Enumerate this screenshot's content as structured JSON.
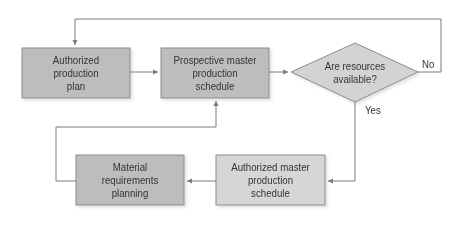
{
  "diagram": {
    "type": "flowchart",
    "colors": {
      "box_dark": "#bdbdbd",
      "box_light": "#d6d6d6",
      "diamond": "#d3d3d3",
      "border": "#8c8c8c",
      "line": "#7a7a7a",
      "text": "#333333"
    },
    "nodes": [
      {
        "id": "authorized-production-plan",
        "shape": "rect",
        "label": "Authorized production plan",
        "lines": [
          "Authorized",
          "production",
          "plan"
        ]
      },
      {
        "id": "prospective-mps",
        "shape": "rect",
        "label": "Prospective master production schedule",
        "lines": [
          "Prospective master",
          "production",
          "schedule"
        ]
      },
      {
        "id": "resources-decision",
        "shape": "diamond",
        "label": "Are resources available?",
        "lines": [
          "Are resources",
          "available?"
        ]
      },
      {
        "id": "authorized-mps",
        "shape": "rect",
        "label": "Authorized master production schedule",
        "lines": [
          "Authorized master",
          "production",
          "schedule"
        ]
      },
      {
        "id": "mrp",
        "shape": "rect",
        "label": "Material requirements planning",
        "lines": [
          "Material",
          "requirements",
          "planning"
        ]
      }
    ],
    "edges": [
      {
        "from": "authorized-production-plan",
        "to": "prospective-mps",
        "label": ""
      },
      {
        "from": "prospective-mps",
        "to": "resources-decision",
        "label": ""
      },
      {
        "from": "resources-decision",
        "to": "authorized-production-plan",
        "label": "No"
      },
      {
        "from": "resources-decision",
        "to": "authorized-mps",
        "label": "Yes"
      },
      {
        "from": "authorized-mps",
        "to": "mrp",
        "label": ""
      },
      {
        "from": "mrp",
        "to": "prospective-mps",
        "label": ""
      }
    ],
    "edge_labels": {
      "no": "No",
      "yes": "Yes"
    }
  }
}
